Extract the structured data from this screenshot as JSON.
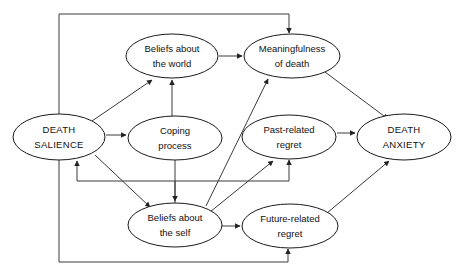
{
  "diagram": {
    "type": "node-link-flow-diagram",
    "colors": {
      "background": "#ffffff",
      "node_fill": "#ffffff",
      "node_stroke": "#1a1a1a",
      "edge_stroke": "#3a3a3a",
      "text": "#111111"
    },
    "nodes": [
      {
        "id": "death-salience",
        "lines": [
          "DEATH",
          "SALIENCE"
        ],
        "line1": "DEATH",
        "line2": "SALIENCE",
        "cx": 59,
        "cy": 137,
        "rx": 46,
        "ry": 23,
        "style": "caps"
      },
      {
        "id": "beliefs-about-the-world",
        "lines": [
          "Beliefs about",
          "the world"
        ],
        "line1": "Beliefs about",
        "line2": "the world",
        "cx": 172,
        "cy": 56,
        "rx": 46,
        "ry": 22,
        "style": "normal"
      },
      {
        "id": "meaningfulness-of-death",
        "lines": [
          "Meaningfulness",
          "of death"
        ],
        "line1": "Meaningfulness",
        "line2": "of death",
        "cx": 292,
        "cy": 56,
        "rx": 48,
        "ry": 22,
        "style": "normal"
      },
      {
        "id": "coping-process",
        "lines": [
          "Coping",
          "process"
        ],
        "line1": "Coping",
        "line2": "process",
        "cx": 175,
        "cy": 138,
        "rx": 47,
        "ry": 22,
        "style": "normal"
      },
      {
        "id": "past-related-regret",
        "lines": [
          "Past-related",
          "regret"
        ],
        "line1": "Past-related",
        "line2": "regret",
        "cx": 289,
        "cy": 137,
        "rx": 47,
        "ry": 22,
        "style": "normal"
      },
      {
        "id": "death-anxiety",
        "lines": [
          "DEATH",
          "ANXIETY"
        ],
        "line1": "DEATH",
        "line2": "ANXIETY",
        "cx": 404,
        "cy": 137,
        "rx": 47,
        "ry": 23,
        "style": "caps"
      },
      {
        "id": "beliefs-about-the-self",
        "lines": [
          "Beliefs about",
          "the self"
        ],
        "line1": "Beliefs about",
        "line2": "the self",
        "cx": 175,
        "cy": 225,
        "rx": 47,
        "ry": 22,
        "style": "normal"
      },
      {
        "id": "future-related-regret",
        "lines": [
          "Future-related",
          "regret"
        ],
        "line1": "Future-related",
        "line2": "regret",
        "cx": 290,
        "cy": 226,
        "rx": 48,
        "ry": 22,
        "style": "normal"
      }
    ],
    "edges": [
      {
        "id": "e1",
        "from": "death-salience",
        "to": "beliefs-about-the-world",
        "kind": "diagonal"
      },
      {
        "id": "e2",
        "from": "death-salience",
        "to": "coping-process",
        "kind": "straight"
      },
      {
        "id": "e3",
        "from": "death-salience",
        "to": "beliefs-about-the-self",
        "kind": "diagonal"
      },
      {
        "id": "e4",
        "from": "death-salience",
        "to": "meaningfulness-of-death",
        "kind": "orthogonal-top-loop"
      },
      {
        "id": "e5",
        "from": "death-salience",
        "to": "future-related-regret",
        "kind": "orthogonal-bottom-loop"
      },
      {
        "id": "e6",
        "from": "coping-process",
        "to": "beliefs-about-the-world",
        "kind": "straight"
      },
      {
        "id": "e7",
        "from": "coping-process",
        "to": "beliefs-about-the-self",
        "kind": "straight"
      },
      {
        "id": "e8",
        "from": "beliefs-about-the-world",
        "to": "meaningfulness-of-death",
        "kind": "straight"
      },
      {
        "id": "e9",
        "from": "beliefs-about-the-self",
        "to": "meaningfulness-of-death",
        "kind": "diagonal"
      },
      {
        "id": "e10",
        "from": "beliefs-about-the-self",
        "to": "past-related-regret",
        "kind": "diagonal"
      },
      {
        "id": "e11",
        "from": "beliefs-about-the-self",
        "to": "future-related-regret",
        "kind": "straight"
      },
      {
        "id": "e12",
        "from": "beliefs-about-the-self",
        "to": "death-salience",
        "kind": "orthogonal-feedback"
      },
      {
        "id": "e13",
        "from": "beliefs-about-the-self",
        "to": "past-related-regret",
        "kind": "orthogonal-feedback"
      },
      {
        "id": "e14",
        "from": "meaningfulness-of-death",
        "to": "death-anxiety",
        "kind": "diagonal"
      },
      {
        "id": "e15",
        "from": "past-related-regret",
        "to": "death-anxiety",
        "kind": "straight"
      },
      {
        "id": "e16",
        "from": "future-related-regret",
        "to": "death-anxiety",
        "kind": "diagonal"
      }
    ]
  }
}
